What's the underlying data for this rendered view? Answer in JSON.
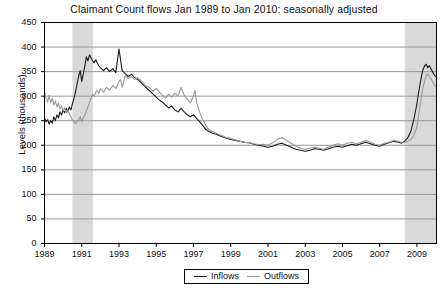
{
  "chart_data": {
    "type": "line",
    "title": "Claimant Count flows Jan 1989 to Jan 2010: seasonally adjusted",
    "xlabel": "",
    "ylabel": "Levels (thousands)",
    "ylim": [
      0,
      450
    ],
    "ytick_values": [
      0,
      50,
      100,
      150,
      200,
      250,
      300,
      350,
      400,
      450
    ],
    "ytick_labels": [
      "0",
      "50",
      "100",
      "150",
      "200",
      "250",
      "300",
      "350",
      "400",
      "450"
    ],
    "xlim": [
      1989.0,
      2010.05
    ],
    "xtick_values": [
      1989,
      1991,
      1993,
      1995,
      1997,
      1999,
      2001,
      2003,
      2005,
      2007,
      2009
    ],
    "xtick_labels": [
      "1989",
      "1991",
      "1993",
      "1995",
      "1997",
      "1999",
      "2001",
      "2003",
      "2005",
      "2007",
      "2009"
    ],
    "grid": "horizontal",
    "grid_color": "#999999",
    "legend_position": "bottom-center",
    "legend_entries": [
      "Inflows",
      "Outflows"
    ],
    "shaded_bands": [
      {
        "label": "recession-band-1",
        "x_start": 1990.5,
        "x_end": 1991.6,
        "color": "#d9d9d9"
      },
      {
        "label": "recession-band-2",
        "x_start": 2008.35,
        "x_end": 2010.05,
        "color": "#d9d9d9"
      }
    ],
    "series": [
      {
        "name": "Inflows",
        "color": "#1a1a1a",
        "x": [
          1989.0,
          1989.08,
          1989.17,
          1989.25,
          1989.33,
          1989.42,
          1989.5,
          1989.58,
          1989.67,
          1989.75,
          1989.83,
          1989.92,
          1990.0,
          1990.08,
          1990.17,
          1990.25,
          1990.33,
          1990.42,
          1990.5,
          1990.58,
          1990.67,
          1990.75,
          1990.83,
          1990.92,
          1991.0,
          1991.08,
          1991.17,
          1991.25,
          1991.33,
          1991.42,
          1991.5,
          1991.58,
          1991.67,
          1991.75,
          1991.83,
          1991.92,
          1992.0,
          1992.17,
          1992.33,
          1992.5,
          1992.67,
          1992.83,
          1993.0,
          1993.17,
          1993.33,
          1993.5,
          1993.67,
          1993.83,
          1994.0,
          1994.17,
          1994.33,
          1994.5,
          1994.67,
          1994.83,
          1995.0,
          1995.17,
          1995.33,
          1995.5,
          1995.67,
          1995.83,
          1996.0,
          1996.17,
          1996.33,
          1996.5,
          1996.67,
          1996.83,
          1997.0,
          1997.17,
          1997.33,
          1997.5,
          1997.67,
          1997.83,
          1998.0,
          1998.25,
          1998.5,
          1998.75,
          1999.0,
          1999.25,
          1999.5,
          1999.75,
          2000.0,
          2000.25,
          2000.5,
          2000.75,
          2001.0,
          2001.25,
          2001.5,
          2001.75,
          2002.0,
          2002.25,
          2002.5,
          2002.75,
          2003.0,
          2003.25,
          2003.5,
          2003.75,
          2004.0,
          2004.25,
          2004.5,
          2004.75,
          2005.0,
          2005.25,
          2005.5,
          2005.75,
          2006.0,
          2006.25,
          2006.5,
          2006.75,
          2007.0,
          2007.25,
          2007.5,
          2007.75,
          2008.0,
          2008.17,
          2008.33,
          2008.5,
          2008.67,
          2008.83,
          2009.0,
          2009.08,
          2009.17,
          2009.25,
          2009.33,
          2009.42,
          2009.5,
          2009.58,
          2009.67,
          2009.75,
          2009.83,
          2009.92,
          2010.0
        ],
        "y": [
          255,
          248,
          252,
          243,
          250,
          245,
          258,
          250,
          262,
          256,
          268,
          262,
          272,
          266,
          275,
          268,
          278,
          272,
          285,
          295,
          310,
          325,
          340,
          352,
          330,
          345,
          362,
          380,
          372,
          384,
          378,
          372,
          368,
          374,
          368,
          362,
          358,
          352,
          358,
          350,
          356,
          348,
          396,
          352,
          346,
          340,
          345,
          338,
          334,
          328,
          322,
          316,
          310,
          304,
          298,
          292,
          288,
          282,
          276,
          280,
          272,
          268,
          275,
          268,
          262,
          258,
          262,
          255,
          248,
          240,
          232,
          228,
          225,
          222,
          218,
          215,
          212,
          210,
          208,
          206,
          205,
          202,
          200,
          198,
          196,
          198,
          202,
          204,
          200,
          196,
          192,
          190,
          188,
          190,
          193,
          192,
          190,
          193,
          196,
          198,
          196,
          199,
          202,
          200,
          203,
          206,
          203,
          200,
          198,
          202,
          205,
          208,
          206,
          204,
          208,
          215,
          228,
          252,
          285,
          305,
          325,
          342,
          355,
          362,
          365,
          358,
          362,
          356,
          350,
          344,
          340
        ]
      },
      {
        "name": "Outflows",
        "color": "#999999",
        "x": [
          1989.0,
          1989.08,
          1989.17,
          1989.25,
          1989.33,
          1989.42,
          1989.5,
          1989.58,
          1989.67,
          1989.75,
          1989.83,
          1989.92,
          1990.0,
          1990.08,
          1990.17,
          1990.25,
          1990.33,
          1990.42,
          1990.5,
          1990.58,
          1990.67,
          1990.75,
          1990.83,
          1990.92,
          1991.0,
          1991.08,
          1991.17,
          1991.25,
          1991.33,
          1991.42,
          1991.5,
          1991.58,
          1991.67,
          1991.75,
          1991.83,
          1991.92,
          1992.0,
          1992.17,
          1992.33,
          1992.5,
          1992.67,
          1992.83,
          1993.0,
          1993.08,
          1993.17,
          1993.33,
          1993.5,
          1993.67,
          1993.83,
          1994.0,
          1994.17,
          1994.33,
          1994.5,
          1994.67,
          1994.83,
          1995.0,
          1995.17,
          1995.33,
          1995.5,
          1995.67,
          1995.83,
          1996.0,
          1996.17,
          1996.33,
          1996.5,
          1996.67,
          1996.83,
          1997.0,
          1997.08,
          1997.17,
          1997.33,
          1997.5,
          1997.67,
          1997.83,
          1998.0,
          1998.25,
          1998.5,
          1998.75,
          1999.0,
          1999.25,
          1999.5,
          1999.75,
          2000.0,
          2000.25,
          2000.5,
          2000.75,
          2001.0,
          2001.25,
          2001.5,
          2001.75,
          2002.0,
          2002.25,
          2002.5,
          2002.75,
          2003.0,
          2003.25,
          2003.5,
          2003.75,
          2004.0,
          2004.25,
          2004.5,
          2004.75,
          2005.0,
          2005.25,
          2005.5,
          2005.75,
          2006.0,
          2006.25,
          2006.5,
          2006.75,
          2007.0,
          2007.25,
          2007.5,
          2007.75,
          2008.0,
          2008.17,
          2008.33,
          2008.5,
          2008.67,
          2008.83,
          2009.0,
          2009.08,
          2009.17,
          2009.25,
          2009.33,
          2009.42,
          2009.5,
          2009.58,
          2009.67,
          2009.75,
          2009.83,
          2009.92,
          2010.0
        ],
        "y": [
          310,
          296,
          288,
          302,
          286,
          296,
          282,
          290,
          278,
          286,
          274,
          280,
          270,
          276,
          266,
          272,
          264,
          258,
          252,
          248,
          244,
          248,
          252,
          258,
          248,
          256,
          262,
          270,
          278,
          288,
          296,
          304,
          300,
          308,
          312,
          306,
          316,
          308,
          318,
          312,
          322,
          316,
          330,
          334,
          318,
          342,
          336,
          340,
          334,
          338,
          332,
          326,
          320,
          316,
          310,
          316,
          308,
          302,
          296,
          304,
          298,
          306,
          300,
          318,
          302,
          294,
          286,
          300,
          312,
          286,
          268,
          252,
          240,
          232,
          228,
          224,
          220,
          216,
          214,
          211,
          208,
          206,
          205,
          203,
          201,
          202,
          200,
          205,
          212,
          216,
          210,
          204,
          198,
          194,
          192,
          194,
          196,
          194,
          192,
          196,
          200,
          203,
          200,
          204,
          206,
          203,
          206,
          210,
          206,
          202,
          200,
          204,
          206,
          210,
          208,
          206,
          205,
          208,
          212,
          220,
          238,
          258,
          280,
          300,
          318,
          332,
          342,
          345,
          340,
          336,
          330,
          324,
          320
        ]
      }
    ]
  }
}
